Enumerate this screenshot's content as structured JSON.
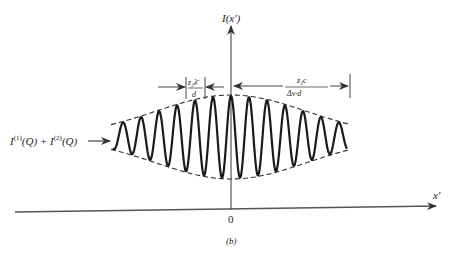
{
  "figure": {
    "caption": "(b)",
    "y_axis_label": "I(x')",
    "x_axis_label": "x'",
    "origin_label": "0",
    "input_label": {
      "I1": "I",
      "sup1": "(1)",
      "Q1": "(Q) + ",
      "I2": "I",
      "sup2": "(2)",
      "Q2": "(Q)"
    },
    "fringe_spacing": {
      "numerator": "z₂λ̄",
      "denominator": "d"
    },
    "coherence_width": {
      "numerator": "z₂c",
      "denominator": "Δν·d"
    }
  },
  "colors": {
    "ink": "#222222",
    "axis": "#555555",
    "background": "#ffffff"
  },
  "wave": {
    "center_x": 231,
    "baseline_y": 137,
    "peak_amplitude": 41,
    "period_px": 18,
    "envelope_sigma_px": 75,
    "x_start": 113,
    "x_end": 347
  }
}
